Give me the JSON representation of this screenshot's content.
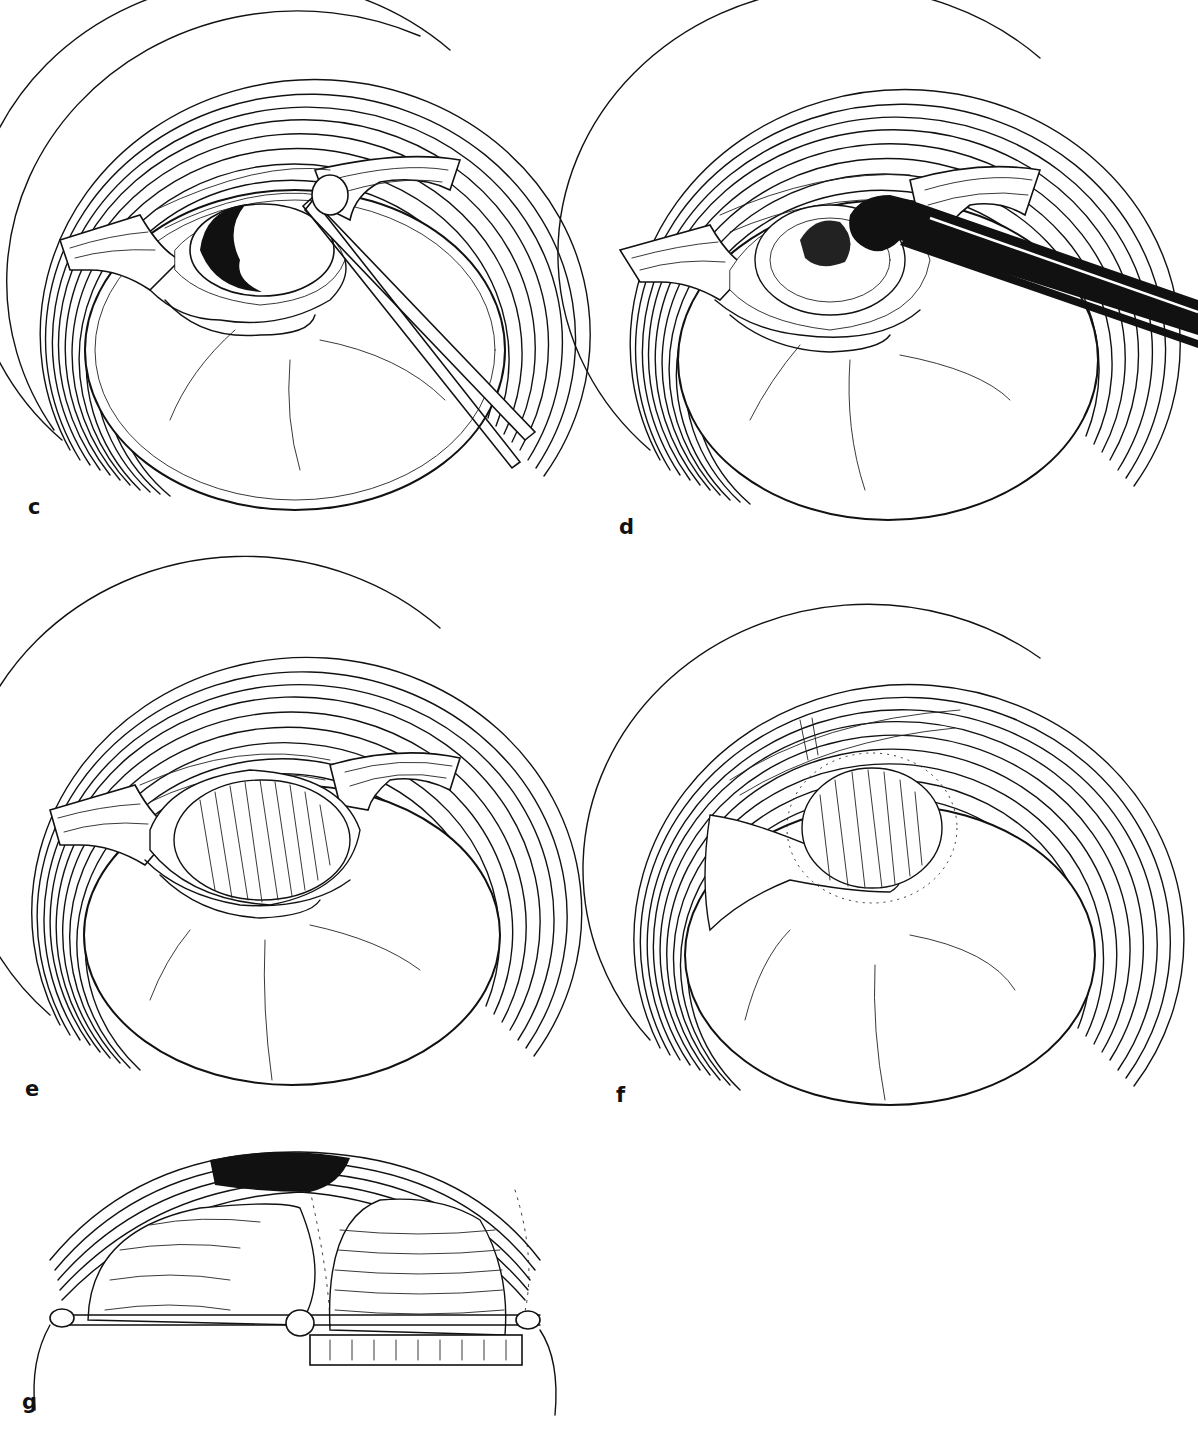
{
  "figure": {
    "panels": [
      {
        "id": "c",
        "label": "c",
        "description": "Ear canal view with tympanic membrane, canal skin flaps retracted, dark perforation area with suction/instrument tip"
      },
      {
        "id": "d",
        "label": "d",
        "description": "Ear canal view with flaps retracted, black cup forceps instrument grasping tissue at perforation margin"
      },
      {
        "id": "e",
        "label": "e",
        "description": "Ear canal view with graft (hatched oval) placed over perforation beneath retracted flaps"
      },
      {
        "id": "f",
        "label": "f",
        "description": "Ear canal view with flaps repositioned over hatched graft, malleus handle visible"
      },
      {
        "id": "g",
        "label": "g",
        "description": "Cross-sectional schematic of canal with layered graft over tympanic membrane and underlying support block"
      }
    ]
  },
  "colors": {
    "background": "#ffffff",
    "ink": "#111111"
  }
}
